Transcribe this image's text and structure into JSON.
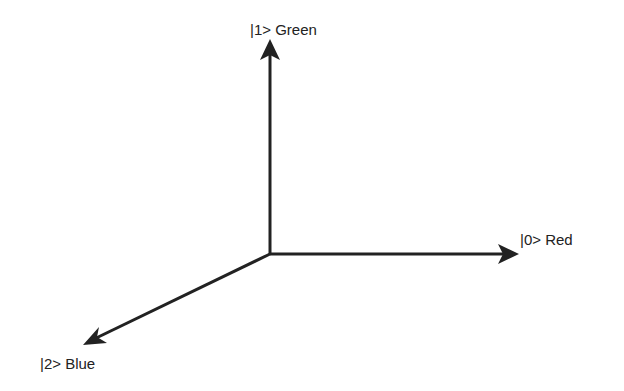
{
  "diagram": {
    "type": "3-axis vector diagram",
    "origin": [
      270,
      254
    ],
    "stroke_color": "#222222",
    "axes": [
      {
        "id": "axis-0",
        "label": "|0> Red",
        "tip": [
          519,
          254
        ],
        "label_pos": [
          520,
          232
        ]
      },
      {
        "id": "axis-1",
        "label": "|1> Green",
        "tip": [
          270,
          39
        ],
        "label_pos": [
          250,
          22
        ]
      },
      {
        "id": "axis-2",
        "label": "|2> Blue",
        "tip": [
          83,
          345
        ],
        "label_pos": [
          40,
          356
        ]
      }
    ]
  }
}
